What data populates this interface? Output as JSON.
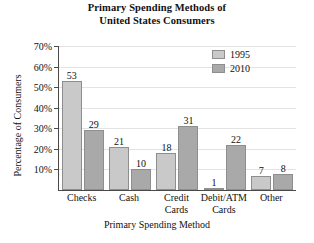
{
  "chart_data": {
    "type": "bar",
    "title": "Primary Spending Methods of United States Consumers",
    "title_lines": [
      "Primary Spending Methods of",
      "United States Consumers"
    ],
    "xlabel": "Primary Spending Method",
    "ylabel": "Percentage of Consumers",
    "categories": [
      "Checks",
      "Cash",
      "Credit Cards",
      "Debit/ATM Cards",
      "Other"
    ],
    "category_lines": [
      [
        "Checks"
      ],
      [
        "Cash"
      ],
      [
        "Credit",
        "Cards"
      ],
      [
        "Debit/ATM",
        "Cards"
      ],
      [
        "Other"
      ]
    ],
    "series": [
      {
        "name": "1995",
        "color": "#c9c9c9",
        "values": [
          53,
          21,
          18,
          1,
          7
        ]
      },
      {
        "name": "2010",
        "color": "#a9a9a9",
        "values": [
          29,
          10,
          31,
          22,
          8
        ]
      }
    ],
    "ylim": [
      0,
      70
    ],
    "ytick_values": [
      10,
      20,
      30,
      40,
      50,
      60,
      70
    ],
    "ytick_labels": [
      "10%",
      "20%",
      "30%",
      "40%",
      "50%",
      "60%",
      "70%"
    ],
    "grid": true,
    "legend_position": "top-right",
    "value_labels": true
  }
}
